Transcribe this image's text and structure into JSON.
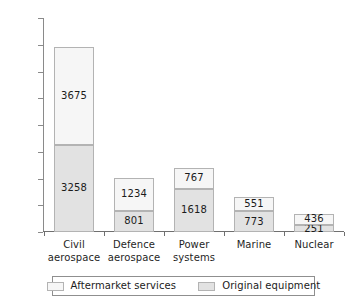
{
  "chart_data": {
    "type": "bar",
    "subtype": "stacked-vertical",
    "title": "",
    "subtitle": "",
    "xlabel": "",
    "ylabel": "",
    "ylim": [
      0,
      8000
    ],
    "ytick_step": 1000,
    "yticks": [
      8000,
      7000,
      6000,
      5000,
      4000,
      3000,
      2000,
      1000,
      0
    ],
    "ytick_labels": [
      "8000",
      "7000",
      "6000",
      "5000",
      "4000",
      "3000",
      "2000",
      "1000",
      "0"
    ],
    "grid": false,
    "legend_position": "bottom",
    "stack_order_bottom_to_top": [
      "Original equipment",
      "Aftermarket services"
    ],
    "categories": [
      "Civil\naerospace",
      "Defence\naerospace",
      "Power\nsystems",
      "Marine",
      "Nuclear"
    ],
    "series": [
      {
        "name": "Original equipment",
        "color": "#e2e2e2",
        "values": [
          3258,
          801,
          1618,
          773,
          251
        ],
        "value_labels": [
          "3258",
          "801",
          "1618",
          "773",
          "251"
        ]
      },
      {
        "name": "Aftermarket services",
        "color": "#f6f6f6",
        "values": [
          3675,
          1234,
          767,
          551,
          436
        ],
        "value_labels": [
          "3675",
          "1234",
          "767",
          "551",
          "436"
        ]
      }
    ],
    "totals": [
      6933,
      2035,
      2385,
      1324,
      687
    ]
  },
  "legend": {
    "items": [
      {
        "label": "Aftermarket services",
        "color": "#f6f6f6"
      },
      {
        "label": "Original equipment",
        "color": "#e2e2e2"
      }
    ]
  },
  "colors": {
    "aftermarket": "#f6f6f6",
    "original_equipment": "#e2e2e2",
    "bar_border": "#b3b3b3",
    "axis": "#6f6f6f",
    "text": "#1b1b1b",
    "background": "#ffffff"
  }
}
